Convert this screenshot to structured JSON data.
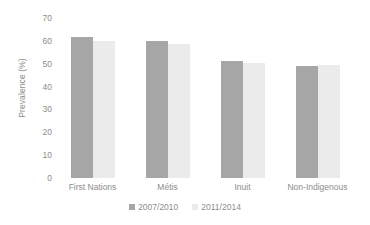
{
  "chart_data": {
    "type": "bar",
    "title": "",
    "subtitle": "",
    "xlabel": "",
    "ylabel": "Prevalence (%)",
    "categories": [
      "First Nations",
      "Métis",
      "Inuit",
      "Non-Indigenous"
    ],
    "series": [
      {
        "name": "2007/2010",
        "color": "#a6a6a6",
        "values": [
          61.5,
          60.0,
          51.0,
          49.0
        ]
      },
      {
        "name": "2011/2014",
        "color": "#ebebeb",
        "values": [
          60.0,
          58.5,
          50.5,
          49.5
        ]
      }
    ],
    "ylim": [
      0,
      70
    ],
    "yticks": [
      0,
      10,
      20,
      30,
      40,
      50,
      60,
      70
    ],
    "ytick_labels": [
      "0",
      "10",
      "20",
      "30",
      "40",
      "50",
      "60",
      "70"
    ],
    "grid": false,
    "legend_position": "bottom",
    "background_color": "#ffffff",
    "text_color": "#8d8d8d"
  },
  "axis": {
    "y_title": "Prevalence (%)"
  },
  "legend": {
    "items": [
      {
        "label": "2007/2010"
      },
      {
        "label": "2011/2014"
      }
    ]
  }
}
